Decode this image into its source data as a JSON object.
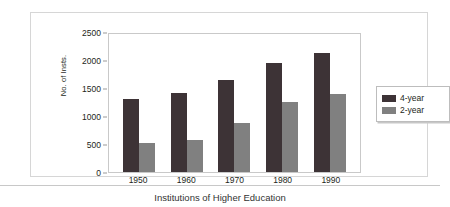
{
  "caption": "Institutions of Higher Education",
  "chart_data": {
    "type": "bar",
    "title": "",
    "xlabel": "",
    "ylabel": "No. of Insts.",
    "categories": [
      "1950",
      "1960",
      "1970",
      "1980",
      "1990"
    ],
    "series": [
      {
        "name": "4-year",
        "color": "#3d3336",
        "values": [
          1300,
          1410,
          1640,
          1940,
          2130
        ]
      },
      {
        "name": "2-year",
        "color": "#808080",
        "values": [
          520,
          570,
          880,
          1250,
          1390
        ]
      }
    ],
    "ylim": [
      0,
      2500
    ],
    "yticks": [
      0,
      500,
      1000,
      1500,
      2000,
      2500
    ],
    "ytick_labels": [
      "0",
      "500",
      "1000",
      "1500",
      "2000",
      "2500"
    ],
    "grid": false,
    "legend_position": "right-outside"
  }
}
